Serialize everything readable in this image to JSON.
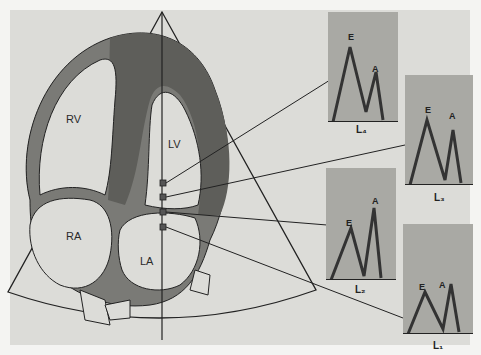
{
  "diagram": {
    "chambers": {
      "rv": "RV",
      "lv": "LV",
      "ra": "RA",
      "la": "LA"
    },
    "panels": [
      {
        "id": "L4",
        "label": "L₄",
        "peak_e": "E",
        "peak_a": "A"
      },
      {
        "id": "L3",
        "label": "L₃",
        "peak_e": "E",
        "peak_a": "A"
      },
      {
        "id": "L2",
        "label": "L₂",
        "peak_e": "E",
        "peak_a": "A"
      },
      {
        "id": "L1",
        "label": "L₁",
        "peak_e": "E",
        "peak_a": "A"
      }
    ],
    "colors": {
      "background": "#dcdcd8",
      "wall": "#7a7a76",
      "myocardium_dark": "#6e6e6a",
      "panel": "#a9a9a4",
      "line": "#222222"
    }
  }
}
